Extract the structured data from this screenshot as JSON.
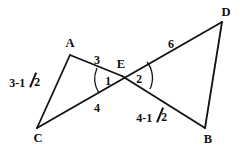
{
  "figure": {
    "background_color": "#ffffff",
    "stroke_color": "#111111",
    "text_color": "#111111",
    "stroke_width": 1.8,
    "arc_stroke_width": 1.3
  },
  "vertices": [
    {
      "name": "A",
      "label": "A",
      "x": 70,
      "y": 55,
      "label_x": 70,
      "label_y": 43
    },
    {
      "name": "C",
      "label": "C",
      "x": 37,
      "y": 128,
      "label_x": 38,
      "label_y": 138
    },
    {
      "name": "E",
      "label": "E",
      "x": 122,
      "y": 76,
      "label_x": 121,
      "label_y": 64
    },
    {
      "name": "D",
      "label": "D",
      "x": 222,
      "y": 22,
      "label_x": 226,
      "label_y": 12
    },
    {
      "name": "B",
      "label": "B",
      "x": 205,
      "y": 128,
      "label_x": 208,
      "label_y": 139
    }
  ],
  "segments": [
    {
      "name": "segment-A-C",
      "from": "A",
      "to": "C",
      "label": "3-1/2",
      "is_mixed_number": true,
      "whole": "3-1",
      "denominator": "2",
      "label_x": 25,
      "label_y": 82
    },
    {
      "name": "segment-A-E",
      "from": "A",
      "to": "E",
      "label": "3",
      "is_mixed_number": false,
      "label_x": 97,
      "label_y": 60
    },
    {
      "name": "segment-C-D",
      "from": "C",
      "to": "D",
      "label_left": "4",
      "label_right": "6",
      "is_mixed_number": false
    },
    {
      "name": "segment-E-C-tick",
      "label": "4",
      "is_mixed_number": false,
      "label_x": 97,
      "label_y": 108
    },
    {
      "name": "segment-E-D",
      "label": "6",
      "is_mixed_number": false,
      "label_x": 171,
      "label_y": 44
    },
    {
      "name": "segment-E-B",
      "label": "4-1/2",
      "is_mixed_number": true,
      "whole": "4-1",
      "denominator": "2",
      "label_x": 152,
      "label_y": 117
    },
    {
      "name": "segment-D-B",
      "from": "D",
      "to": "B",
      "label": "",
      "is_mixed_number": false
    }
  ],
  "angles": [
    {
      "name": "angle-1",
      "label": "1",
      "label_x": 108,
      "label_y": 82,
      "at_vertex": "E",
      "opens": "left"
    },
    {
      "name": "angle-2",
      "label": "2",
      "label_x": 139,
      "label_y": 80,
      "at_vertex": "E",
      "opens": "right"
    }
  ]
}
